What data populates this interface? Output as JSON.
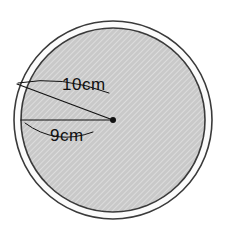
{
  "figure": {
    "background_color": "#ffffff",
    "outer_circle": {
      "name": "outer-circle",
      "center_x": 113,
      "center_y": 120,
      "radius": 99,
      "fill_color": "#fbfbfb",
      "stroke_color": "#3a3a3a",
      "stroke_width": 1.6
    },
    "inner_circle": {
      "name": "inner-circle",
      "center_x": 113,
      "center_y": 120,
      "radius": 92,
      "fill_color": "#c9c9c9",
      "stroke_color": "#3a3a3a",
      "stroke_width": 1.6
    },
    "center_point": {
      "name": "center-dot",
      "x": 113,
      "y": 120,
      "radius": 3,
      "color": "#111111"
    },
    "radius_lines": [
      {
        "name": "outer-radius-line",
        "label": "10cm",
        "x1": 113,
        "y1": 120,
        "x2": 17,
        "y2": 84,
        "stroke_color": "#111111",
        "stroke_width": 1.1
      },
      {
        "name": "inner-radius-line",
        "label": "9cm",
        "x1": 113,
        "y1": 120,
        "x2": 21,
        "y2": 120,
        "stroke_color": "#111111",
        "stroke_width": 1.1
      }
    ],
    "labels": {
      "outer_radius": "10cm",
      "inner_radius": "9cm"
    },
    "leader_arcs": [
      {
        "name": "outer-label-leader-arc",
        "path": "M 18 83 Q 60 76 108 92",
        "stroke_color": "#111111",
        "stroke_width": 1.0
      },
      {
        "name": "inner-label-leader-arc",
        "path": "M 25 122 Q 55 145 92 131",
        "stroke_color": "#111111",
        "stroke_width": 1.0
      }
    ],
    "hatching": {
      "name": "diagonal-hatch-pattern",
      "color": "#ffffff",
      "opacity": 0.35,
      "spacing": 4,
      "angle_deg": 45
    }
  }
}
